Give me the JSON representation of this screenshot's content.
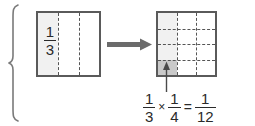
{
  "diagram": {
    "brace": {
      "name": "grouping-brace"
    },
    "left_model": {
      "label": "left-area-model",
      "columns": 3,
      "rows": 1,
      "shaded_columns": 1,
      "fraction": {
        "numerator": "1",
        "denominator": "3"
      },
      "fill_color": "#f1f1f1",
      "border_color": "#5a5a5a",
      "divider_color": "#555555"
    },
    "arrow": {
      "label": "transform-arrow",
      "direction": "right",
      "color": "#6b6b6b"
    },
    "right_model": {
      "label": "right-area-model",
      "columns": 3,
      "rows": 4,
      "column_shade_color": "#f1f1f1",
      "product_cell_color": "#c9c9c9",
      "border_color": "#5a5a5a",
      "divider_color": "#555555",
      "callout": {
        "label": "product-cell-callout",
        "direction": "up",
        "color": "#4a4a4a"
      }
    },
    "equation": {
      "label": "fraction-multiplication-equation",
      "factor1": {
        "numerator": "1",
        "denominator": "3"
      },
      "operator": "×",
      "factor2": {
        "numerator": "1",
        "denominator": "4"
      },
      "equals": "=",
      "product": {
        "numerator": "1",
        "denominator": "12"
      },
      "plain_text": "1/3 × 1/4 = 1/12"
    }
  }
}
